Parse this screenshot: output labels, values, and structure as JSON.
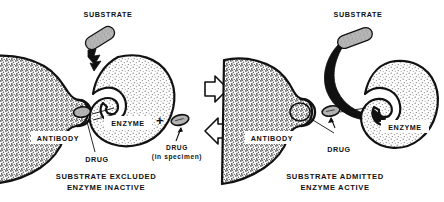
{
  "diagram": {
    "title_semantic": "enzyme-multiplied-immunoassay-antibody-drug-competition",
    "background_color": "#ffffff",
    "ink_color": "#111111",
    "antibody_fill": "#9a9a9a",
    "enzyme_fill": "#d0d0d0",
    "substrate_fill": "#a8a8a8",
    "drug_fill": "#b4b4b4"
  },
  "panels": [
    {
      "id": "left",
      "name": "drug-bound-panel",
      "substrate_label": "SUBSTRATE",
      "antibody_label": "ANTIBODY",
      "enzyme_label": "ENZYME",
      "drug_label": "DRUG",
      "caption_line1": "SUBSTRATE  EXCLUDED",
      "caption_line2": "ENZYME  INACTIVE"
    },
    {
      "id": "right",
      "name": "drug-displaced-panel",
      "substrate_label": "SUBSTRATE",
      "antibody_label": "ANTIBODY",
      "enzyme_label": "ENZYME",
      "drug_label": "DRUG",
      "caption_line1": "SUBSTRATE  ADMITTED",
      "caption_line2": "ENZYME  ACTIVE"
    }
  ],
  "center": {
    "plus_sign": "+",
    "free_drug_label": "DRUG",
    "free_drug_sublabel": "(in specimen)",
    "arrow_forward_name": "block-arrow-right",
    "arrow_back_name": "block-arrow-left"
  }
}
